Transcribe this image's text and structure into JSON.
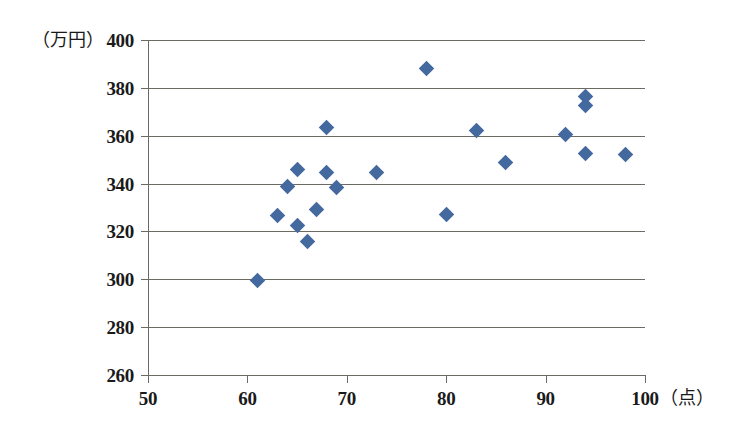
{
  "axes": {
    "y_unit_label": "（万円）",
    "x_unit_label": "（点）",
    "y_ticks": [
      400,
      380,
      360,
      340,
      320,
      300,
      280,
      260
    ],
    "x_ticks": [
      50,
      60,
      70,
      80,
      90,
      100
    ]
  },
  "style": {
    "marker_color": "#43699f",
    "grid_color": "#6b6b63",
    "background": "#ffffff"
  },
  "chart_data": {
    "type": "scatter",
    "title": "",
    "xlabel": "（点）",
    "ylabel": "（万円）",
    "xlim": [
      50,
      100
    ],
    "ylim": [
      260,
      400
    ],
    "xticks": [
      50,
      60,
      70,
      80,
      90,
      100
    ],
    "yticks": [
      260,
      280,
      300,
      320,
      340,
      360,
      380,
      400
    ],
    "grid": "horizontal",
    "legend": "none",
    "series": [
      {
        "name": "",
        "points": [
          [
            61,
            299.6
          ],
          [
            63,
            326.6
          ],
          [
            64,
            338.6
          ],
          [
            65,
            345.8
          ],
          [
            65,
            322.6
          ],
          [
            66,
            315.6
          ],
          [
            67,
            329.0
          ],
          [
            68,
            363.6
          ],
          [
            68,
            344.6
          ],
          [
            69,
            338.4
          ],
          [
            73,
            344.6
          ],
          [
            78,
            388.0
          ],
          [
            80,
            327.0
          ],
          [
            83,
            362.0
          ],
          [
            86,
            349.0
          ],
          [
            92,
            360.4
          ],
          [
            94,
            376.4
          ],
          [
            94,
            372.6
          ],
          [
            94,
            352.4
          ],
          [
            98,
            352.0
          ]
        ]
      }
    ]
  }
}
